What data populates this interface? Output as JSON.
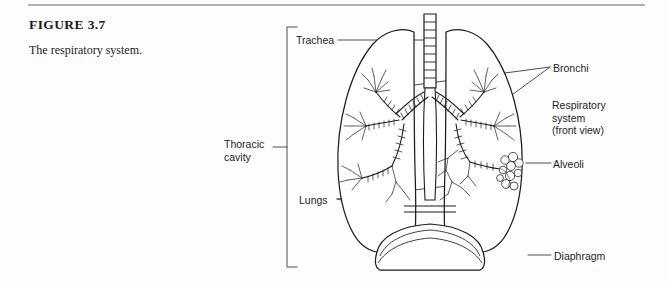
{
  "figure": {
    "number": "FIGURE 3.7",
    "caption": "The respiratory system."
  },
  "diagram": {
    "bracket_label": "Thoracic\ncavity",
    "labels": {
      "trachea": "Trachea",
      "lungs": "Lungs",
      "bronchi": "Bronchi",
      "respiratory_system": "Respiratory\nsystem\n(front view)",
      "alveoli": "Alveoli",
      "diaphragm": "Diaphragm"
    }
  },
  "colors": {
    "rule": "#b0b0b0",
    "ink": "#1d1d1d",
    "line": "#3a3a3a",
    "background": "#fdfdfd"
  }
}
